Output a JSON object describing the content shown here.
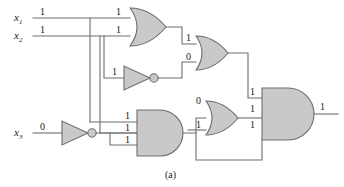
{
  "figure": {
    "caption": "(a)",
    "type": "logic-circuit-diagram",
    "colors": {
      "gate_fill": "#c9c9c9",
      "stroke": "#6e6e6e",
      "background": "#ffffff",
      "text": "#1a1a1a"
    }
  },
  "inputs": [
    {
      "name": "x1",
      "var": "x",
      "subscript": "1",
      "value": "1"
    },
    {
      "name": "x2",
      "var": "x",
      "subscript": "2",
      "value": "1"
    },
    {
      "name": "x3",
      "var": "x",
      "subscript": "3",
      "value": "0"
    }
  ],
  "gates": [
    {
      "id": "or1",
      "kind": "OR",
      "label": "or-gate-top",
      "input_values": [
        "1",
        "1"
      ],
      "output_value": "1"
    },
    {
      "id": "not1",
      "kind": "NOT",
      "label": "not-gate-middle",
      "input_values": [
        "1"
      ],
      "output_value": "0"
    },
    {
      "id": "not2",
      "kind": "NOT",
      "label": "not-gate-x3",
      "input_values": [
        "0"
      ],
      "output_value": "1"
    },
    {
      "id": "and1",
      "kind": "AND",
      "label": "and-gate-lower-left",
      "input_values": [
        "1",
        "1",
        "1"
      ],
      "output_value": "1"
    },
    {
      "id": "or2",
      "kind": "OR",
      "label": "or-gate-upper-mid",
      "input_values": [
        "1",
        "0"
      ],
      "output_value": "1"
    },
    {
      "id": "or3",
      "kind": "OR",
      "label": "or-gate-lower-mid",
      "input_values": [
        "0",
        "1"
      ],
      "output_value": "1"
    },
    {
      "id": "and2",
      "kind": "AND",
      "label": "and-gate-output",
      "input_values": [
        "1",
        "1",
        "1"
      ],
      "output_value": "1"
    }
  ],
  "wire_labels": {
    "x1_value": "1",
    "x2_value": "1",
    "x3_value": "0",
    "or1_in_a": "1",
    "or1_in_b": "1",
    "not1_in": "1",
    "and1_in_a": "1",
    "and1_in_b": "1",
    "and1_in_c": "1",
    "or2_in_a": "1",
    "or2_in_b": "0",
    "or3_in_a": "0",
    "or3_in_b": "1",
    "and2_in_a": "1",
    "and2_in_b": "1",
    "and2_in_c": "1",
    "output": "1"
  }
}
